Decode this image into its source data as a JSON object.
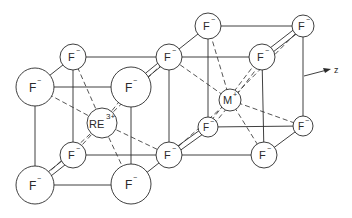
{
  "figure": {
    "axis_label": "z",
    "colors": {
      "line": "#2a2a2a",
      "background": "#ffffff"
    }
  },
  "ions": {
    "f_front_tl": {
      "label": "F",
      "charge": "−"
    },
    "f_front_tr": {
      "label": "F",
      "charge": "−"
    },
    "f_front_bl": {
      "label": "F",
      "charge": "−"
    },
    "f_front_br": {
      "label": "F",
      "charge": "−"
    },
    "f_back_tl": {
      "label": "F",
      "charge": "−"
    },
    "f_back_tr": {
      "label": "F",
      "charge": "−"
    },
    "f_back_bl": {
      "label": "F",
      "charge": "−"
    },
    "f_back_br": {
      "label": "F",
      "charge": "−"
    },
    "re": {
      "label": "RE",
      "charge": "3+"
    },
    "m": {
      "label": "M",
      "charge": "+"
    },
    "f_right_tl": {
      "label": "F",
      "charge": "−"
    },
    "f_right_tr": {
      "label": "F",
      "charge": "−"
    },
    "f_right_mid": {
      "label": "F",
      "charge": "−"
    },
    "f_right_bl": {
      "label": "F",
      "charge": "−"
    },
    "f_right_br": {
      "label": "F",
      "charge": "−"
    },
    "f_right_low": {
      "label": "F",
      "charge": "−"
    }
  }
}
